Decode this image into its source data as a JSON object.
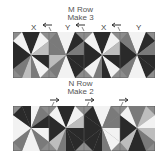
{
  "m_row": {
    "title_line1": "M Row",
    "title_line2": "Make 3",
    "labels": [
      "X",
      "Y",
      "X",
      "Y"
    ],
    "arrow_direction": "left",
    "block_count": 4
  },
  "n_row": {
    "title_line1": "N Row",
    "title_line2": "Make 2",
    "arrow_direction": "right",
    "block_count": 4
  },
  "colors": {
    "dark": "#2a2a2a",
    "medium": "#7a7a7a",
    "light": "#f2f2f2",
    "mid_light": "#bdbdbd",
    "background": "#8c8c8c",
    "border": "#555555"
  }
}
